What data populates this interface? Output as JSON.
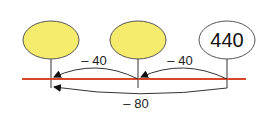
{
  "diagram": {
    "type": "number-line-subtraction",
    "colors": {
      "line": "#d9472b",
      "filled_bubble": "#f5ec6e",
      "empty_bubble": "#ffffff",
      "stroke": "#333333"
    },
    "bubbles": [
      {
        "value": "",
        "filled": true
      },
      {
        "value": "",
        "filled": true
      },
      {
        "value": "440",
        "filled": false
      }
    ],
    "jumps": [
      {
        "label": "– 40",
        "from": 2,
        "to": 1
      },
      {
        "label": "– 40",
        "from": 1,
        "to": 0
      },
      {
        "label": "– 80",
        "from": 2,
        "to": 0
      }
    ]
  }
}
